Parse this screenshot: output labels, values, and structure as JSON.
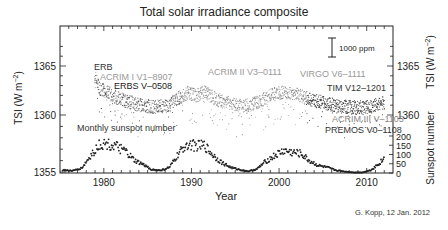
{
  "chart_data": {
    "type": "scatter",
    "title": "Total solar irradiance composite",
    "xlabel": "Year",
    "ylabel": "TSI (W m^-2)",
    "ylabel_right_top": "TSI (W m^-2)",
    "ylabel_right_bottom": "Sunspot number",
    "xlim": [
      1975,
      2013
    ],
    "ylim": [
      1355,
      1368
    ],
    "x_ticks": [
      1980,
      1990,
      2000,
      2010
    ],
    "y_ticks_left": [
      1355,
      1360,
      1365
    ],
    "y_ticks_right_tsi": [
      1360,
      1365
    ],
    "y_ticks_right_sunspot": [
      0,
      50,
      100,
      150,
      200
    ],
    "scale_bar": "1000 ppm",
    "grid": false,
    "annotations": [
      {
        "text": "ERB",
        "color": "#333333"
      },
      {
        "text": "ACRIM I V1–8907",
        "color": "#999999"
      },
      {
        "text": "ERBS V–0508",
        "color": "#222222"
      },
      {
        "text": "ACRIM II V3–0111",
        "color": "#999999"
      },
      {
        "text": "VIRGO V6–1111",
        "color": "#999999"
      },
      {
        "text": "TIM V12–1201",
        "color": "#333333"
      },
      {
        "text": "ACRIM III V–1105",
        "color": "#888888"
      },
      {
        "text": "PREMOS V0–1108",
        "color": "#333333"
      },
      {
        "text": "Monthly sunspot number",
        "color": "#333333"
      }
    ],
    "series": [
      {
        "name": "TSI composite",
        "x": [
          1978.9,
          1979.5,
          1980.5,
          1981.5,
          1982.5,
          1983.5,
          1984.5,
          1985.5,
          1986.5,
          1987.5,
          1988.5,
          1989.5,
          1990.5,
          1991.5,
          1992.5,
          1993.5,
          1994.5,
          1995.5,
          1996.5,
          1997.5,
          1998.5,
          1999.5,
          2000.5,
          2001.5,
          2002.5,
          2003.5,
          2004.5,
          2005.5,
          2006.5,
          2007.5,
          2008.5,
          2009.5,
          2010.5,
          2011.5
        ],
        "values": [
          1364.0,
          1362.8,
          1362.3,
          1361.8,
          1361.5,
          1361.2,
          1361.0,
          1360.9,
          1360.9,
          1361.1,
          1361.8,
          1362.3,
          1362.0,
          1362.4,
          1361.8,
          1361.4,
          1361.2,
          1361.0,
          1361.0,
          1361.3,
          1361.8,
          1362.2,
          1362.4,
          1362.3,
          1362.0,
          1361.6,
          1361.4,
          1361.2,
          1361.0,
          1360.9,
          1360.8,
          1360.8,
          1360.9,
          1361.2
        ]
      },
      {
        "name": "Monthly sunspot number",
        "x": [
          1975.5,
          1976.5,
          1977.5,
          1978.5,
          1979.5,
          1980.5,
          1981.5,
          1982.5,
          1983.5,
          1984.5,
          1985.5,
          1986.5,
          1987.5,
          1988.5,
          1989.5,
          1990.5,
          1991.5,
          1992.5,
          1993.5,
          1994.5,
          1995.5,
          1996.5,
          1997.5,
          1998.5,
          1999.5,
          2000.5,
          2001.5,
          2002.5,
          2003.5,
          2004.5,
          2005.5,
          2006.5,
          2007.5,
          2008.5,
          2009.5,
          2010.5,
          2011.5,
          2012.0
        ],
        "values": [
          15,
          12,
          27,
          92,
          155,
          155,
          140,
          115,
          66,
          45,
          18,
          14,
          30,
          100,
          160,
          145,
          148,
          95,
          55,
          30,
          18,
          9,
          22,
          64,
          93,
          120,
          111,
          104,
          64,
          40,
          30,
          15,
          8,
          3,
          3,
          16,
          55,
          80
        ]
      }
    ]
  },
  "credit": "G. Kopp, 12 Jan. 2012"
}
